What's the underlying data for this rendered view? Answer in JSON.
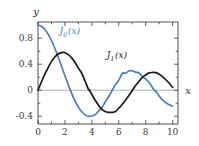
{
  "chart_data": {
    "type": "line",
    "title": "",
    "subtitle": "",
    "xlabel": "x",
    "ylabel": "y",
    "xlim": [
      0,
      10.4
    ],
    "ylim": [
      -0.52,
      1.05
    ],
    "grid": false,
    "legend_position": "inline-annotations",
    "xticks": [
      0,
      2,
      4,
      6,
      8,
      10
    ],
    "xtick_labels": [
      "0",
      "2",
      "4",
      "6",
      "8",
      "10"
    ],
    "xminor_ticks": [
      1,
      3,
      5,
      7,
      9
    ],
    "yticks": [
      0.8,
      0.4,
      0,
      -0.4
    ],
    "ytick_labels": [
      "0.8",
      "0.4",
      "0",
      "-0.4"
    ],
    "yminor_ticks": [
      0.6,
      0.2,
      -0.2
    ],
    "zero_line": true,
    "series": [
      {
        "name": "J_0(x)",
        "label": "J",
        "label_sub": "0",
        "label_arg": "(x)",
        "color": "#4a7ebb",
        "annotation_x": 1.6,
        "annotation_y": 0.86,
        "x": [
          0,
          0.25,
          0.5,
          0.75,
          1,
          1.25,
          1.5,
          1.75,
          2,
          2.25,
          2.4,
          2.5,
          2.75,
          3,
          3.25,
          3.5,
          3.75,
          4,
          4.25,
          4.5,
          4.75,
          5,
          5.25,
          5.52,
          5.75,
          6,
          6.25,
          6.5,
          6.75,
          7,
          7.25,
          7.5,
          7.75,
          8,
          8.25,
          8.5,
          8.65,
          8.75,
          9,
          9.25,
          9.5,
          9.75,
          10
        ],
        "y": [
          1.0,
          0.9844,
          0.9385,
          0.8642,
          0.7652,
          0.6459,
          0.5118,
          0.369,
          0.2239,
          0.0827,
          0.0025,
          -0.0484,
          -0.1641,
          -0.2601,
          -0.3325,
          -0.3801,
          -0.4026,
          -0.3971,
          -0.3766,
          -0.3205,
          -0.2693,
          -0.1776,
          -0.0968,
          0.0,
          0.0859,
          0.1506,
          0.2601,
          0.2601,
          0.2951,
          0.3001,
          0.2786,
          0.2663,
          0.215,
          0.1717,
          0.1222,
          0.0419,
          0.0,
          -0.0142,
          -0.0903,
          -0.1507,
          -0.1939,
          -0.2243,
          -0.2459
        ]
      },
      {
        "name": "J_1(x)",
        "label": "J",
        "label_sub": "1",
        "label_arg": "(x)",
        "color": "#1a1a1a",
        "annotation_x": 5.1,
        "annotation_y": 0.49,
        "x": [
          0,
          0.25,
          0.5,
          0.75,
          1,
          1.25,
          1.5,
          1.75,
          1.84,
          2,
          2.25,
          2.5,
          2.75,
          3,
          3.25,
          3.5,
          3.75,
          3.83,
          4,
          4.25,
          4.5,
          4.75,
          5,
          5.25,
          5.33,
          5.5,
          5.75,
          6,
          6.25,
          6.5,
          6.75,
          7,
          7.016,
          7.25,
          7.5,
          7.75,
          8,
          8.25,
          8.5,
          8.75,
          9,
          9.25,
          9.5,
          9.75,
          10
        ],
        "y": [
          0,
          0.124,
          0.2423,
          0.3492,
          0.4401,
          0.5106,
          0.5579,
          0.5802,
          0.5819,
          0.5767,
          0.5484,
          0.4971,
          0.4272,
          0.3391,
          0.2613,
          0.1374,
          0.0128,
          0.0,
          -0.066,
          -0.1538,
          -0.2311,
          -0.2951,
          -0.3276,
          -0.3414,
          -0.3403,
          -0.3414,
          -0.329,
          -0.2767,
          -0.2196,
          -0.1538,
          -0.0816,
          -0.0047,
          0.0,
          0.0717,
          0.1352,
          0.1962,
          0.2346,
          0.2663,
          0.2731,
          0.2697,
          0.2453,
          0.2097,
          0.1613,
          0.1066,
          0.0435
        ]
      }
    ]
  },
  "labels": {
    "y_axis": "y",
    "x_axis": "x"
  },
  "colors": {
    "series_blue": "#4a7ebb",
    "series_black": "#1a1a1a",
    "frame": "#3a3a3a",
    "zero_line": "#9a9a9a",
    "background": "#ffffff",
    "tick_text": "#3b3b3b"
  }
}
